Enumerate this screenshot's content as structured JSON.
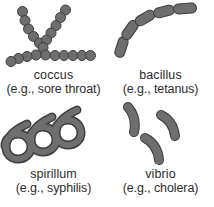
{
  "figure": {
    "background_color": "#ffffff",
    "organism_fill_color": "#6e6e6e",
    "organism_outline_color": "#3d3d3d",
    "text_color": "#2b2b2b"
  },
  "items": [
    {
      "id": "coccus",
      "name": "coccus",
      "example": "(e.g., sore throat)",
      "shape": "branching-chain-of-spheres",
      "icon": "coccus-chain-icon"
    },
    {
      "id": "bacillus",
      "name": "bacillus",
      "example": "(e.g., tetanus)",
      "shape": "curved-chain-of-rods",
      "icon": "bacillus-rod-chain-icon"
    },
    {
      "id": "spirillum",
      "name": "spirillum",
      "example": "(e.g., syphilis)",
      "shape": "helical-coil",
      "icon": "spirillum-helix-icon"
    },
    {
      "id": "vibrio",
      "name": "vibrio",
      "example": "(e.g., cholera)",
      "shape": "comma-shaped-curved-rods",
      "icon": "vibrio-comma-icon"
    }
  ]
}
